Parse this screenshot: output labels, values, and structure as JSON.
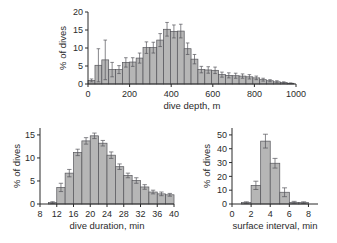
{
  "figure": {
    "background": "#ffffff",
    "bar_fill": "#b6b6b6",
    "bar_stroke": "#55555a",
    "axis_color": "#2b2b2b",
    "error_color": "#55555a"
  },
  "chart_data": [
    {
      "id": "dive-depth",
      "type": "bar",
      "title": "",
      "xlabel": "dive depth, m",
      "ylabel": "% of dives",
      "xlim": [
        0,
        1000
      ],
      "ylim": [
        0,
        20
      ],
      "xticks": [
        0,
        200,
        400,
        600,
        800,
        1000
      ],
      "xticklabels": [
        "0",
        "200",
        "400",
        "600",
        "800",
        "1000"
      ],
      "yticks": [
        0,
        5,
        10,
        15,
        20
      ],
      "yticklabels": [
        "0",
        "5",
        "10",
        "15",
        "20"
      ],
      "grid": false,
      "legend": "none",
      "bin_width": 33,
      "categories": [
        17,
        50,
        83,
        116,
        149,
        182,
        215,
        248,
        281,
        314,
        347,
        380,
        413,
        446,
        479,
        512,
        545,
        578,
        611,
        644,
        677,
        710,
        743,
        776,
        809,
        842,
        875,
        908,
        941,
        974
      ],
      "values": [
        1.0,
        5.2,
        6.7,
        4.0,
        4.0,
        6.0,
        6.1,
        7.2,
        10.1,
        10.1,
        12.2,
        15.2,
        14.6,
        14.7,
        9.8,
        6.9,
        4.0,
        3.9,
        3.8,
        2.6,
        2.4,
        2.3,
        2.2,
        2.0,
        1.7,
        1.2,
        0.9,
        0.6,
        0.4,
        0.2
      ],
      "errors": [
        0.4,
        4.6,
        5.5,
        2.0,
        1.1,
        1.3,
        1.2,
        1.4,
        1.6,
        1.5,
        1.8,
        1.9,
        1.8,
        1.9,
        1.6,
        1.3,
        0.9,
        0.9,
        0.9,
        0.7,
        0.7,
        0.7,
        0.6,
        0.6,
        0.5,
        0.4,
        0.3,
        0.3,
        0.2,
        0.1
      ]
    },
    {
      "id": "dive-duration",
      "type": "bar",
      "title": "",
      "xlabel": "dive duration, min",
      "ylabel": "% of dives",
      "xlim": [
        8,
        40
      ],
      "ylim": [
        0,
        16.5
      ],
      "xticks": [
        8,
        12,
        16,
        20,
        24,
        28,
        32,
        36,
        40
      ],
      "xticklabels": [
        "8",
        "12",
        "16",
        "20",
        "24",
        "28",
        "32",
        "36",
        "40"
      ],
      "yticks": [
        0,
        5,
        10,
        15
      ],
      "yticklabels": [
        "0",
        "5",
        "10",
        "15"
      ],
      "grid": false,
      "legend": "none",
      "bin_width": 2,
      "categories": [
        11,
        13,
        15,
        17,
        19,
        21,
        23,
        25,
        27,
        29,
        31,
        33,
        35,
        37,
        39
      ],
      "values": [
        0.3,
        3.6,
        6.7,
        11.2,
        13.7,
        14.8,
        13.2,
        10.6,
        8.1,
        6.2,
        5.1,
        3.7,
        2.6,
        2.2,
        2.0
      ],
      "errors": [
        0.2,
        0.9,
        0.8,
        0.7,
        0.7,
        0.6,
        0.6,
        0.7,
        0.6,
        0.5,
        0.6,
        0.5,
        0.4,
        0.4,
        0.3
      ]
    },
    {
      "id": "surface-interval",
      "type": "bar",
      "title": "",
      "xlabel": "surface interval, min",
      "ylabel": "% of dives",
      "xlim": [
        0,
        9
      ],
      "ylim": [
        0,
        55
      ],
      "xticks": [
        0,
        2,
        4,
        6,
        8
      ],
      "xticklabels": [
        "0",
        "2",
        "4",
        "6",
        "8"
      ],
      "yticks": [
        0,
        10,
        20,
        30,
        40,
        50
      ],
      "yticklabels": [
        "0",
        "10",
        "20",
        "30",
        "40",
        "50"
      ],
      "grid": false,
      "legend": "none",
      "bin_width": 1,
      "categories": [
        1.5,
        2.5,
        3.5,
        4.5,
        5.5,
        6.5,
        7.5
      ],
      "values": [
        1.0,
        13.5,
        45.5,
        29.5,
        8.5,
        1.2,
        1.0
      ],
      "errors": [
        0.6,
        3.0,
        5.0,
        3.5,
        3.2,
        0.7,
        0.6
      ]
    }
  ]
}
